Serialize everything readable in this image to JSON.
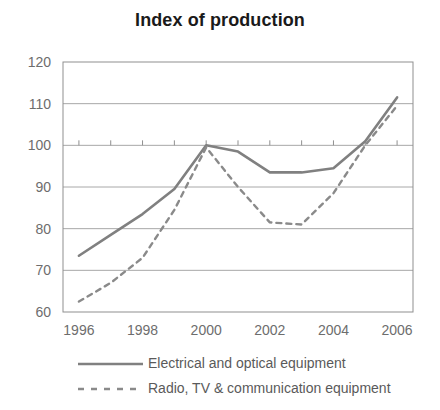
{
  "chart_data": {
    "type": "line",
    "title": "Index of production",
    "xlabel": "",
    "ylabel": "",
    "x": [
      1996,
      1997,
      1998,
      1999,
      2000,
      2001,
      2002,
      2003,
      2004,
      2005,
      2006
    ],
    "xlim": [
      1995.5,
      2006.5
    ],
    "ylim": [
      60,
      120
    ],
    "xticks": [
      1996,
      1998,
      2000,
      2002,
      2004,
      2006
    ],
    "xtick_labels": [
      "1996",
      "1998",
      "2000",
      "2002",
      "2004",
      "2006"
    ],
    "yticks": [
      60,
      70,
      80,
      90,
      100,
      110,
      120
    ],
    "ytick_labels": [
      "60",
      "70",
      "80",
      "90",
      "100",
      "110",
      "120"
    ],
    "grid": true,
    "grid_color": "#a8a8a8",
    "baseline_value": 100,
    "legend_position": "bottom",
    "series": [
      {
        "name": "Electrical and optical equipment",
        "style": "solid",
        "color": "#808080",
        "values": [
          73.5,
          78.5,
          83.5,
          89.5,
          100.0,
          98.5,
          93.5,
          93.5,
          94.5,
          101.0,
          111.5
        ]
      },
      {
        "name": "Radio, TV & communication equipment",
        "style": "dashed",
        "color": "#8a8a8a",
        "values": [
          62.5,
          67.0,
          73.0,
          84.5,
          99.5,
          90.0,
          81.5,
          81.0,
          88.5,
          100.0,
          109.5
        ]
      }
    ]
  },
  "legend": {
    "items": [
      {
        "label": "Electrical and optical equipment",
        "style": "solid"
      },
      {
        "label": "Radio, TV & communication equipment",
        "style": "dashed"
      }
    ]
  }
}
